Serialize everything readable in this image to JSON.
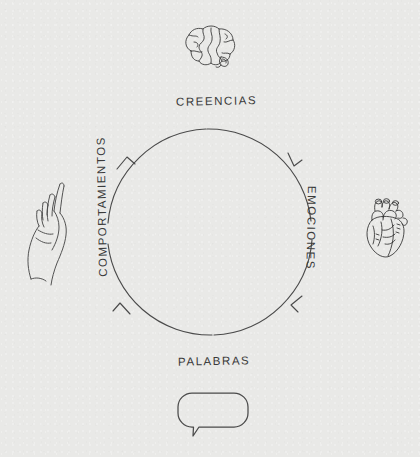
{
  "diagram": {
    "type": "cyclical-flow",
    "direction": "clockwise",
    "background_color": "#e9e9e7",
    "ink_color": "#3b3b3b",
    "circle": {
      "cx": 210,
      "cy": 232,
      "r": 103
    },
    "nodes": [
      {
        "id": "creencias",
        "label": "CREENCIAS",
        "position": "top",
        "icon": "brain-icon"
      },
      {
        "id": "emociones",
        "label": "EMOCIONES",
        "position": "right",
        "icon": "heart-icon"
      },
      {
        "id": "palabras",
        "label": "PALABRAS",
        "position": "bottom",
        "icon": "speech-bubble-icon"
      },
      {
        "id": "comportamientos",
        "label": "COMPORTAMIENTOS",
        "position": "left",
        "icon": "hand-icon"
      }
    ],
    "arrows": [
      {
        "id": "arrow-top-right",
        "from": "creencias",
        "to": "emociones"
      },
      {
        "id": "arrow-bottom-right",
        "from": "emociones",
        "to": "palabras"
      },
      {
        "id": "arrow-bottom-left",
        "from": "palabras",
        "to": "comportamientos"
      },
      {
        "id": "arrow-top-left",
        "from": "comportamientos",
        "to": "creencias"
      }
    ]
  }
}
